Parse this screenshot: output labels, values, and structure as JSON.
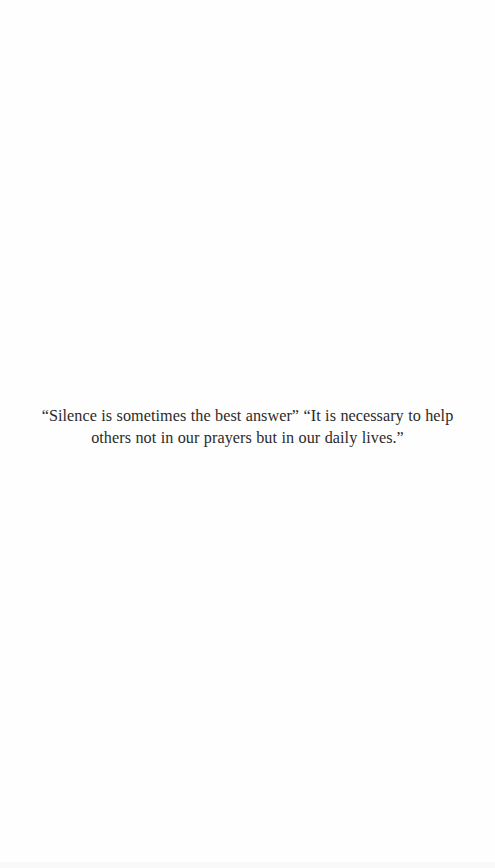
{
  "document": {
    "quote_text": "“Silence is sometimes the best answer” “It is necessary to help others not in our prayers but in our daily lives.”",
    "colors": {
      "background": "#fefefe",
      "text": "#2b2b2b"
    }
  }
}
